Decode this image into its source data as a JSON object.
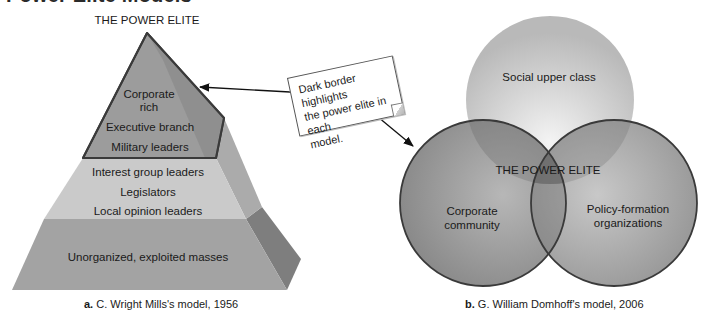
{
  "page": {
    "title": "Power Elite Models"
  },
  "colors": {
    "pyramid_top_front": "#9a9a9a",
    "pyramid_top_side": "#7c7c7c",
    "pyramid_mid_front": "#c8c8c8",
    "pyramid_mid_side": "#a9a9a9",
    "pyramid_bottom_front": "#a4a4a4",
    "pyramid_bottom_side": "#808080",
    "elite_border": "#3a3a3a",
    "circle_top": "#c2c2c2",
    "circle_lower": "#8e8e8e",
    "circle_border": "#3a3a3a"
  },
  "mills_model": {
    "heading": "THE POWER ELITE",
    "tiers": [
      {
        "name": "power-elite",
        "highlighted": true,
        "lines": [
          "Corporate",
          "rich",
          "Executive branch",
          "Military leaders"
        ]
      },
      {
        "name": "middle-level",
        "highlighted": false,
        "lines": [
          "Interest group leaders",
          "Legislators",
          "Local opinion leaders"
        ]
      },
      {
        "name": "masses",
        "highlighted": false,
        "lines": [
          "Unorganized, exploited masses"
        ]
      }
    ],
    "caption_prefix": "a.",
    "caption_text": "C. Wright Mills's model, 1956"
  },
  "domhoff_model": {
    "circles": [
      {
        "name": "social-upper-class",
        "lines": [
          "Social upper class"
        ]
      },
      {
        "name": "corporate-community",
        "lines": [
          "Corporate",
          "community"
        ]
      },
      {
        "name": "policy-formation-organizations",
        "lines": [
          "Policy-formation",
          "organizations"
        ]
      }
    ],
    "intersection_label": "THE POWER ELITE",
    "caption_prefix": "b.",
    "caption_text": "G. William Domhoff's model, 2006"
  },
  "callout": {
    "lines": [
      "Dark border highlights",
      "the power elite in each",
      "model."
    ]
  }
}
